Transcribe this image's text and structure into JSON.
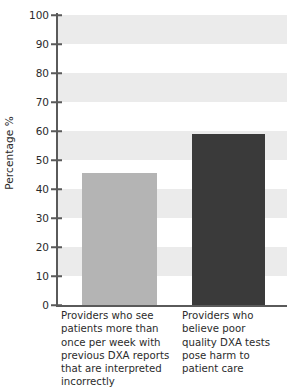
{
  "chart_data": {
    "type": "bar",
    "title": "",
    "xlabel": "",
    "ylabel": "Percentage %",
    "categories": [
      "Providers who see patients more than once per week with previous DXA reports that are interpreted incorrectly",
      "Providers who believe poor quality DXA tests pose harm to patient care"
    ],
    "values": [
      45.5,
      59
    ],
    "ylim": [
      0,
      100
    ],
    "yticks": [
      0,
      10,
      20,
      30,
      40,
      50,
      60,
      70,
      80,
      90,
      100
    ],
    "ytick_labels": [
      "0",
      "10",
      "20",
      "30",
      "40",
      "50",
      "60",
      "70",
      "80",
      "90",
      "100"
    ],
    "grid": false,
    "banded_background": true,
    "band_ranges": [
      [
        10,
        20
      ],
      [
        30,
        40
      ],
      [
        50,
        60
      ],
      [
        70,
        80
      ],
      [
        90,
        100
      ]
    ],
    "legend": null,
    "colors": {
      "bar_0": "#b4b4b4",
      "bar_1": "#3a3a3a",
      "band": "#ebebeb",
      "axis": "#5a5a5a",
      "text": "#2b2b2b",
      "background": "#ffffff"
    }
  }
}
